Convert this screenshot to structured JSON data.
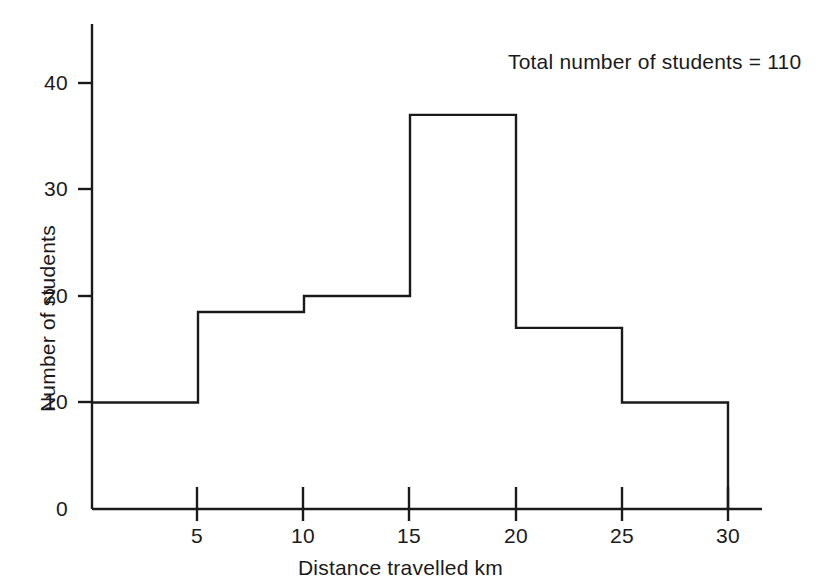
{
  "chart_data": {
    "type": "bar",
    "title": "",
    "subtitle": "",
    "xlabel": "Distance travelled  km",
    "ylabel": "Number of students",
    "annotation": "Total number of students  =  110",
    "grid": false,
    "legend": null,
    "xlim": [
      0,
      32
    ],
    "ylim": [
      0,
      45
    ],
    "xticks": [
      5,
      10,
      15,
      20,
      25,
      30
    ],
    "xtick_labels": [
      "5",
      "10",
      "15",
      "20",
      "25",
      "30"
    ],
    "yticks": [
      0,
      10,
      20,
      30,
      40
    ],
    "ytick_labels": [
      "0",
      "10",
      "20",
      "30",
      "40"
    ],
    "bin_edges": [
      0,
      5,
      10,
      15,
      20,
      25,
      30
    ],
    "categories": [
      "0-5",
      "5-10",
      "10-15",
      "15-20",
      "20-25",
      "25-30"
    ],
    "values": [
      10,
      18.5,
      20,
      37,
      17,
      10
    ],
    "total": 110,
    "bar_fill": "#ffffff",
    "bar_stroke": "#1a1a1a",
    "axis_color": "#1a1a1a",
    "background": "#ffffff"
  },
  "axes": {
    "y_axis_name": "y-axis",
    "x_axis_name": "x-axis"
  }
}
